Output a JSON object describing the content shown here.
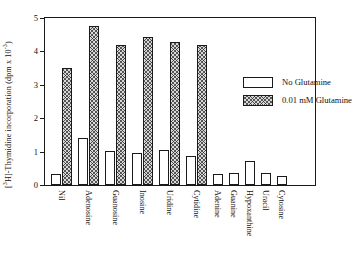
{
  "chart_data": {
    "type": "bar",
    "title": "",
    "xlabel": "",
    "ylabel": "[3H]-Thymidine incorporation (dpm x 10-3)",
    "ylabel_prefix": "[",
    "ylabel_sup1": "3",
    "ylabel_mid": "H]-Thymidine incorporation (dpm x 10",
    "ylabel_sup2": "-3",
    "ylabel_suffix": ")",
    "ylim": [
      0,
      5
    ],
    "yticks": [
      0,
      1,
      2,
      3,
      4,
      5
    ],
    "ytick_labels": [
      "0",
      "1",
      "2",
      "3",
      "4",
      "5"
    ],
    "grid": false,
    "legend_position": "upper-right-inside",
    "categories": [
      "Nil",
      "Adenosine",
      "Guanosine",
      "Inosine",
      "Uridine",
      "Cytidine",
      "Adenine",
      "Guanine",
      "Hypoxanthine",
      "Uracil",
      "Cytosine"
    ],
    "series": [
      {
        "name": "No Glutamine",
        "pattern": "open",
        "values": [
          0.32,
          1.4,
          1.02,
          0.95,
          1.06,
          0.88,
          0.33,
          0.35,
          0.72,
          0.37,
          0.28
        ]
      },
      {
        "name": "0.01 mM Glutamine",
        "pattern": "hatched",
        "values": [
          3.5,
          4.75,
          4.2,
          4.42,
          4.28,
          4.2,
          null,
          null,
          null,
          null,
          null
        ]
      }
    ]
  },
  "legend": {
    "items": [
      {
        "label": "No Glutamine",
        "pattern": "open"
      },
      {
        "label": "0.01 mM Glutamine",
        "pattern": "hatched"
      }
    ]
  }
}
